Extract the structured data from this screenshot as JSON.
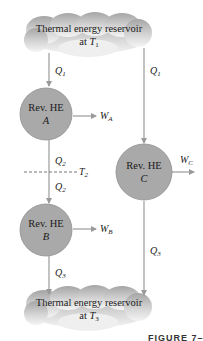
{
  "diagram": {
    "top_reservoir": {
      "line1": "Thermal energy reservoir",
      "line2_prefix": "at ",
      "temp_symbol": "T",
      "temp_sub": "1"
    },
    "bottom_reservoir": {
      "line1": "Thermal energy reservoir",
      "line2_prefix": "at ",
      "temp_symbol": "T",
      "temp_sub": "3"
    },
    "engines": [
      {
        "id": "A",
        "label": "Rev. HE",
        "name": "A",
        "work_symbol": "W",
        "work_sub": "A"
      },
      {
        "id": "B",
        "label": "Rev. HE",
        "name": "B",
        "work_symbol": "W",
        "work_sub": "B"
      },
      {
        "id": "C",
        "label": "Rev. HE",
        "name": "C",
        "work_symbol": "W",
        "work_sub": "C"
      }
    ],
    "heat_flows": {
      "q1_left": {
        "symbol": "Q",
        "sub": "1"
      },
      "q1_right": {
        "symbol": "Q",
        "sub": "1"
      },
      "q2_upper": {
        "symbol": "Q",
        "sub": "2"
      },
      "q2_lower": {
        "symbol": "Q",
        "sub": "2"
      },
      "q3_left": {
        "symbol": "Q",
        "sub": "3"
      },
      "q3_right": {
        "symbol": "Q",
        "sub": "3"
      }
    },
    "intermediate_temp": {
      "symbol": "T",
      "sub": "2"
    },
    "caption": "FIGURE 7–10"
  },
  "colors": {
    "engine_fill": "#a9a9a9",
    "engine_stroke": "#8a8a8a",
    "line": "#9a9a9a",
    "cloud_top": "#a8a8a8",
    "cloud_bottom": "#f2f2f2"
  }
}
